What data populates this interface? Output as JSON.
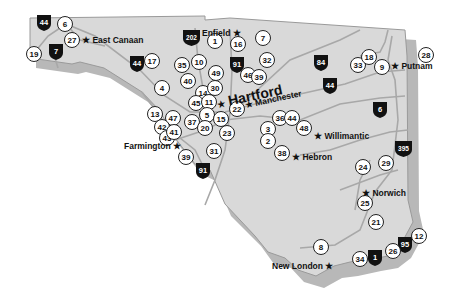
{
  "colors": {
    "land": "#d9d9d9",
    "outline": "#9a9a9a",
    "shadow": "#b8b8b8",
    "roads": "#a8a8a8",
    "shield": "#111111",
    "marker_fill": "#ffffff"
  },
  "cities": [
    {
      "id": "east-canaan",
      "name": "East Canaan"
    },
    {
      "id": "enfield",
      "name": "Enfield"
    },
    {
      "id": "hartford",
      "name": "Hartford"
    },
    {
      "id": "manchester",
      "name": "Manchester"
    },
    {
      "id": "putnam",
      "name": "Putnam"
    },
    {
      "id": "farmington",
      "name": "Farmington"
    },
    {
      "id": "willimantic",
      "name": "Willimantic"
    },
    {
      "id": "hebron",
      "name": "Hebron"
    },
    {
      "id": "norwich",
      "name": "Norwich"
    },
    {
      "id": "new-london",
      "name": "New London"
    }
  ],
  "star_symbol": "★",
  "highway_shields": [
    {
      "id": "i44-nw",
      "label": "44"
    },
    {
      "id": "i7",
      "label": "7"
    },
    {
      "id": "i44-w",
      "label": "44"
    },
    {
      "id": "i202",
      "label": "202"
    },
    {
      "id": "i91-n",
      "label": "91"
    },
    {
      "id": "i84",
      "label": "84"
    },
    {
      "id": "i44-e",
      "label": "44"
    },
    {
      "id": "i6",
      "label": "6"
    },
    {
      "id": "i395",
      "label": "395"
    },
    {
      "id": "i91-s",
      "label": "91"
    },
    {
      "id": "i95",
      "label": "95"
    },
    {
      "id": "i1",
      "label": "1"
    }
  ],
  "markers": [
    {
      "id": "m6",
      "label": "6"
    },
    {
      "id": "m27",
      "label": "27"
    },
    {
      "id": "m19",
      "label": "19"
    },
    {
      "id": "m17",
      "label": "17"
    },
    {
      "id": "m1",
      "label": "1"
    },
    {
      "id": "m16",
      "label": "16"
    },
    {
      "id": "m7",
      "label": "7"
    },
    {
      "id": "m35",
      "label": "35"
    },
    {
      "id": "m10",
      "label": "10"
    },
    {
      "id": "m32",
      "label": "32"
    },
    {
      "id": "m49",
      "label": "49"
    },
    {
      "id": "m46",
      "label": "46"
    },
    {
      "id": "m39",
      "label": "39"
    },
    {
      "id": "m40",
      "label": "40"
    },
    {
      "id": "m4",
      "label": "4"
    },
    {
      "id": "m14",
      "label": "14"
    },
    {
      "id": "m30",
      "label": "30"
    },
    {
      "id": "m45",
      "label": "45"
    },
    {
      "id": "m11",
      "label": "11"
    },
    {
      "id": "m5",
      "label": "5"
    },
    {
      "id": "m22",
      "label": "22"
    },
    {
      "id": "m13",
      "label": "13"
    },
    {
      "id": "m47",
      "label": "47"
    },
    {
      "id": "m42",
      "label": "42"
    },
    {
      "id": "m43",
      "label": "43"
    },
    {
      "id": "m41",
      "label": "41"
    },
    {
      "id": "m37",
      "label": "37"
    },
    {
      "id": "m20",
      "label": "20"
    },
    {
      "id": "m15",
      "label": "15"
    },
    {
      "id": "m23",
      "label": "23"
    },
    {
      "id": "m31",
      "label": "31"
    },
    {
      "id": "m39b",
      "label": "39"
    },
    {
      "id": "m33",
      "label": "33"
    },
    {
      "id": "m18",
      "label": "18"
    },
    {
      "id": "m9",
      "label": "9"
    },
    {
      "id": "m28",
      "label": "28"
    },
    {
      "id": "m36",
      "label": "36"
    },
    {
      "id": "m44",
      "label": "44"
    },
    {
      "id": "m3",
      "label": "3"
    },
    {
      "id": "m48",
      "label": "48"
    },
    {
      "id": "m2",
      "label": "2"
    },
    {
      "id": "m38",
      "label": "38"
    },
    {
      "id": "m24",
      "label": "24"
    },
    {
      "id": "m29",
      "label": "29"
    },
    {
      "id": "m25",
      "label": "25"
    },
    {
      "id": "m21",
      "label": "21"
    },
    {
      "id": "m8",
      "label": "8"
    },
    {
      "id": "m34",
      "label": "34"
    },
    {
      "id": "m26",
      "label": "26"
    },
    {
      "id": "m12",
      "label": "12"
    }
  ]
}
